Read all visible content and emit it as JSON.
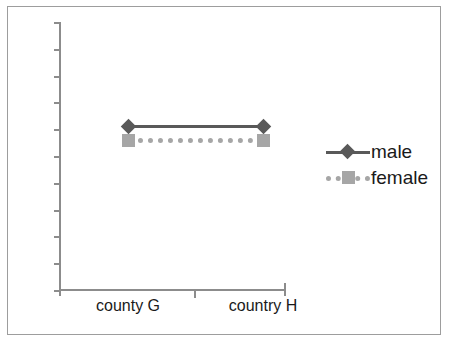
{
  "chart_data": {
    "type": "line",
    "title": "",
    "subtitle": "",
    "xlabel": "",
    "ylabel": "",
    "categories": [
      "county G",
      "country H"
    ],
    "series": [
      {
        "name": "male",
        "values": [
          1,
          1
        ],
        "color": "#595959",
        "line_style": "solid",
        "marker": "diamond"
      },
      {
        "name": "female",
        "values": [
          0.95,
          0.95
        ],
        "color": "#a6a6a6",
        "line_style": "dotted",
        "marker": "square"
      }
    ],
    "grid": false,
    "legend_position": "right",
    "y_axis": {
      "labels_shown": false,
      "tick_count": 11
    },
    "x_axis": {
      "tick_labels": [
        "county G",
        "country H"
      ]
    },
    "annotations": []
  },
  "legend": {
    "entries": [
      {
        "label": "male",
        "color": "#595959",
        "line_style": "solid",
        "marker": "diamond"
      },
      {
        "label": "female",
        "color": "#a6a6a6",
        "line_style": "dotted",
        "marker": "square"
      }
    ]
  },
  "axes": {
    "x_tick_labels": [
      "county G",
      "country H"
    ]
  },
  "colors": {
    "male": "#595959",
    "female": "#a6a6a6",
    "axis": "#8c8c8c",
    "frame": "#9d9d9d",
    "text": "#1a1a1a",
    "background": "#ffffff"
  }
}
